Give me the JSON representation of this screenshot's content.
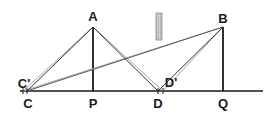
{
  "diagram": {
    "type": "geometry-reflection",
    "colors": {
      "line": "#1a1a1a",
      "ray_light": "#9a9a9a",
      "obstacle_fill": "#c8c8c8",
      "obstacle_stroke": "#8a8a8a"
    },
    "labels": {
      "A": "A",
      "B": "B",
      "C": "C",
      "C_prime": "C'",
      "D": "D",
      "D_prime": "D'",
      "P": "P",
      "Q": "Q"
    },
    "points": {
      "A": [
        93,
        27
      ],
      "B": [
        223,
        27
      ],
      "C": [
        27,
        91
      ],
      "C_prime": [
        23,
        91
      ],
      "D": [
        158,
        91
      ],
      "D_prime": [
        163,
        91
      ],
      "P": [
        93,
        91
      ],
      "Q": [
        223,
        91
      ]
    },
    "segments": [
      {
        "from": "C",
        "to": "Q",
        "note": "ground line"
      },
      {
        "from": "A",
        "to": "P",
        "note": "vertical pole A"
      },
      {
        "from": "B",
        "to": "Q",
        "note": "vertical pole B"
      },
      {
        "from": "A",
        "to": "C"
      },
      {
        "from": "A",
        "to": "D"
      },
      {
        "from": "B",
        "to": "C"
      },
      {
        "from": "B",
        "to": "D"
      },
      {
        "from": "A",
        "to": "C_prime",
        "style": "light"
      },
      {
        "from": "A",
        "to": "D_prime",
        "style": "light"
      },
      {
        "from": "B",
        "to": "C_prime",
        "style": "light"
      },
      {
        "from": "B",
        "to": "D_prime",
        "style": "light"
      }
    ],
    "obstacle": {
      "shape": "rectangle",
      "x": 156,
      "y": 13,
      "width": 6,
      "height": 27
    }
  }
}
